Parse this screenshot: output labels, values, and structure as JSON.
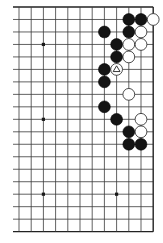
{
  "board": {
    "title": "Go board diagram (upper-right area, full height)",
    "board_size": 19,
    "visible_columns": 12,
    "visible_rows": 19,
    "edges": {
      "top": true,
      "right": true,
      "bottom": true,
      "left": false
    },
    "geometry": {
      "origin_x": 19,
      "origin_y": 7,
      "spacing_x": 12.2,
      "spacing_y": 12.48,
      "left_stub": 6,
      "stone_radius": 5.9
    },
    "colors": {
      "background": "#ffffff",
      "line": "#3a3a3a",
      "black_stone": "#141414",
      "white_stone": "#ffffff"
    },
    "star_points": [
      {
        "col": 2,
        "row": 3
      },
      {
        "col": 2,
        "row": 9
      },
      {
        "col": 2,
        "row": 15
      },
      {
        "col": 8,
        "row": 15
      },
      {
        "col": 8,
        "row": 3
      },
      {
        "col": 8,
        "row": 9
      }
    ],
    "stones": [
      {
        "color": "black",
        "col": 9,
        "row": 1
      },
      {
        "color": "black",
        "col": 10,
        "row": 1
      },
      {
        "color": "white",
        "col": 11,
        "row": 1
      },
      {
        "color": "black",
        "col": 7,
        "row": 2
      },
      {
        "color": "black",
        "col": 9,
        "row": 2
      },
      {
        "color": "white",
        "col": 10,
        "row": 2
      },
      {
        "color": "black",
        "col": 8,
        "row": 3
      },
      {
        "color": "white",
        "col": 9,
        "row": 3
      },
      {
        "color": "white",
        "col": 10,
        "row": 3
      },
      {
        "color": "black",
        "col": 8,
        "row": 4
      },
      {
        "color": "white",
        "col": 9,
        "row": 4
      },
      {
        "color": "black",
        "col": 7,
        "row": 5
      },
      {
        "color": "white",
        "col": 8,
        "row": 5,
        "marker": "triangle"
      },
      {
        "color": "black",
        "col": 7,
        "row": 6
      },
      {
        "color": "white",
        "col": 9,
        "row": 7
      },
      {
        "color": "black",
        "col": 7,
        "row": 8
      },
      {
        "color": "black",
        "col": 8,
        "row": 9
      },
      {
        "color": "white",
        "col": 10,
        "row": 9
      },
      {
        "color": "black",
        "col": 9,
        "row": 10
      },
      {
        "color": "white",
        "col": 10,
        "row": 10
      },
      {
        "color": "black",
        "col": 9,
        "row": 11
      },
      {
        "color": "black",
        "col": 10,
        "row": 11
      }
    ],
    "last_move_marker": {
      "type": "triangle",
      "col": 8,
      "row": 5,
      "on": "white"
    }
  }
}
